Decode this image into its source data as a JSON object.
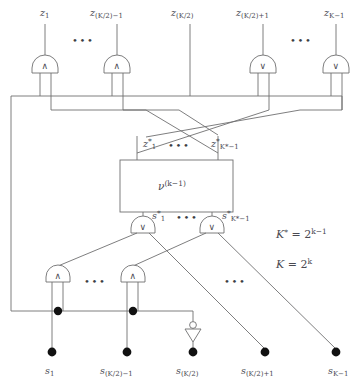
{
  "figure": {
    "kind": "logic-circuit-diagram",
    "title_text": "",
    "stroke_color": "#6f6f70",
    "text_color": "#4a4a52",
    "node_color": "#111111",
    "background": "#ffffff"
  },
  "inputs": {
    "ellipsis": "•••",
    "labels": [
      {
        "base": "z",
        "sub": "1",
        "x": 116,
        "y": 8
      },
      {
        "base": "z",
        "sub": "(K/2)−1",
        "x": 90,
        "y": 8
      },
      {
        "base": "z",
        "sub": "(K/2)",
        "x": 175,
        "y": 8
      },
      {
        "base": "z",
        "sub": "(K/2)+1",
        "x": 237,
        "y": 8
      },
      {
        "base": "z",
        "sub": "K−1",
        "x": 324,
        "y": 8
      }
    ]
  },
  "outputs": {
    "ellipsis": "•••",
    "labels": [
      {
        "base": "s",
        "sub": "1",
        "x": 47,
        "y": 368
      },
      {
        "base": "s",
        "sub": "(K/2)−1",
        "x": 119,
        "y": 368
      },
      {
        "base": "s",
        "sub": "(K/2)",
        "x": 193,
        "y": 368
      },
      {
        "base": "s",
        "sub": "(K/2)+1",
        "x": 265,
        "y": 368
      },
      {
        "base": "s",
        "sub": "K−1",
        "x": 336,
        "y": 368
      }
    ]
  },
  "gates": {
    "top_row": [
      {
        "name": "and-gate-z1",
        "symbol": "∧",
        "type": "AND",
        "cx": 45,
        "cy": 68
      },
      {
        "name": "and-gate-zk2m1",
        "symbol": "∧",
        "type": "AND",
        "cx": 117,
        "cy": 68
      },
      {
        "name": "or-gate-zk2p1",
        "symbol": "∨",
        "type": "OR",
        "cx": 263,
        "cy": 68
      },
      {
        "name": "or-gate-zkm1",
        "symbol": "∨",
        "type": "OR",
        "cx": 336,
        "cy": 68
      }
    ],
    "mid_row": [
      {
        "name": "or-gate-s-star-1",
        "symbol": "∨",
        "type": "OR",
        "cx": 143,
        "cy": 228
      },
      {
        "name": "or-gate-s-star-kstar-m1",
        "symbol": "∨",
        "type": "OR",
        "cx": 212,
        "cy": 228
      }
    ],
    "bottom_row": [
      {
        "name": "and-gate-s1",
        "symbol": "∧",
        "type": "AND",
        "cx": 58,
        "cy": 277
      },
      {
        "name": "and-gate-sk2m1",
        "symbol": "∧",
        "type": "AND",
        "cx": 133,
        "cy": 277
      }
    ],
    "inverter": {
      "name": "not-gate-sk2",
      "type": "NOT",
      "cx": 193,
      "cy": 331
    }
  },
  "module_box": {
    "name": "recursive-module",
    "label_base": "ν",
    "label_sup": "(k−1)",
    "x": 120,
    "y": 160,
    "width": 113,
    "height": 52
  },
  "internal_signals": {
    "top": [
      {
        "base": "z",
        "star": "*",
        "sub": "1",
        "x": 146,
        "y": 142
      },
      {
        "base": "z",
        "star": "*",
        "sub": "K*−1",
        "x": 208,
        "y": 142
      }
    ],
    "bottom": [
      {
        "base": "s",
        "star": "*",
        "sub": "1",
        "x": 155,
        "y": 214
      },
      {
        "base": "s",
        "star": "*",
        "sub": "K*−1",
        "x": 222,
        "y": 214
      }
    ],
    "ellipsis": "•••"
  },
  "equations": [
    {
      "name": "equation-k-star",
      "lhs": "K",
      "star": "*",
      "op": " = ",
      "base": "2",
      "exp": "k−1",
      "x": 278,
      "y": 234
    },
    {
      "name": "equation-k",
      "lhs": "K",
      "star": "",
      "op": " = ",
      "base": "2",
      "exp": "k",
      "x": 278,
      "y": 263
    }
  ],
  "ellipses_marks": [
    {
      "name": "ellipsis-top-left",
      "x": 76,
      "y": 40
    },
    {
      "name": "ellipsis-top-right",
      "x": 294,
      "y": 40
    },
    {
      "name": "ellipsis-bottom-left",
      "x": 88,
      "y": 281
    },
    {
      "name": "ellipsis-bottom-right",
      "x": 228,
      "y": 281
    }
  ]
}
